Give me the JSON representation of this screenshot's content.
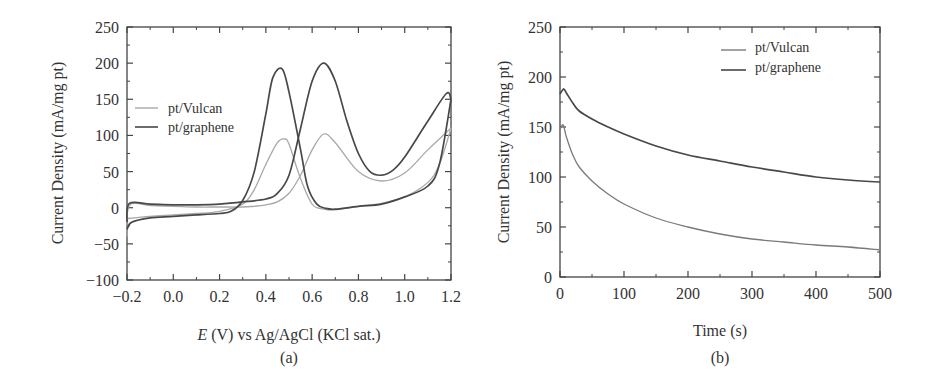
{
  "chart_data": [
    {
      "panel": "(a)",
      "type": "line",
      "title": "",
      "xlabel_italic": "E",
      "xlabel_rest": " (V) vs Ag/AgCl (KCl sat.)",
      "ylabel": "Current Density (mA/mg pt)",
      "xlim": [
        -0.2,
        1.2
      ],
      "ylim": [
        -100,
        250
      ],
      "xticks": [
        "−0.2",
        "0.0",
        "0.2",
        "0.4",
        "0.6",
        "0.8",
        "1.0",
        "1.2"
      ],
      "yticks": [
        "250",
        "200",
        "150",
        "100",
        "50",
        "0",
        "−50",
        "−100"
      ],
      "legend_position": "upper left",
      "series": [
        {
          "name": "pt/Vulcan",
          "color": "#a8a8a8",
          "forward_scan": {
            "x": [
              -0.2,
              -0.19,
              -0.1,
              0.0,
              0.1,
              0.2,
              0.3,
              0.35,
              0.4,
              0.45,
              0.5,
              0.55,
              0.6,
              0.65,
              0.7,
              0.8,
              0.9,
              1.0,
              1.1,
              1.2
            ],
            "y": [
              -40,
              3,
              3,
              2,
              1,
              1,
              1,
              2,
              4,
              8,
              20,
              45,
              80,
              102,
              90,
              50,
              37,
              48,
              80,
              110
            ]
          },
          "reverse_scan": {
            "x": [
              1.2,
              1.15,
              1.1,
              1.0,
              0.9,
              0.8,
              0.7,
              0.65,
              0.6,
              0.55,
              0.5,
              0.48,
              0.45,
              0.4,
              0.35,
              0.3,
              0.2,
              0.1,
              0.0,
              -0.1,
              -0.2
            ],
            "y": [
              110,
              60,
              35,
              15,
              6,
              2,
              -3,
              -2,
              5,
              40,
              88,
              95,
              90,
              60,
              25,
              5,
              -5,
              -8,
              -10,
              -12,
              -15
            ]
          }
        },
        {
          "name": "pt/graphene",
          "color": "#484848",
          "forward_scan": {
            "x": [
              -0.2,
              -0.19,
              -0.1,
              0.0,
              0.1,
              0.2,
              0.3,
              0.4,
              0.45,
              0.5,
              0.55,
              0.6,
              0.65,
              0.7,
              0.75,
              0.8,
              0.85,
              0.9,
              0.95,
              1.0,
              1.1,
              1.18,
              1.2
            ],
            "y": [
              -20,
              6,
              5,
              4,
              4,
              5,
              8,
              12,
              20,
              45,
              110,
              175,
              200,
              175,
              120,
              75,
              50,
              45,
              52,
              70,
              120,
              158,
              150
            ]
          },
          "reverse_scan": {
            "x": [
              1.2,
              1.15,
              1.1,
              1.0,
              0.9,
              0.8,
              0.7,
              0.66,
              0.62,
              0.58,
              0.55,
              0.5,
              0.47,
              0.43,
              0.4,
              0.35,
              0.3,
              0.25,
              0.2,
              0.1,
              0.0,
              -0.1,
              -0.18,
              -0.2
            ],
            "y": [
              150,
              60,
              30,
              15,
              5,
              2,
              -2,
              -1,
              5,
              30,
              80,
              160,
              192,
              180,
              130,
              50,
              10,
              -5,
              -8,
              -10,
              -12,
              -14,
              -20,
              -30
            ]
          }
        }
      ]
    },
    {
      "panel": "(b)",
      "type": "line",
      "title": "",
      "xlabel": "Time (s)",
      "ylabel": "Current Density (mA/mg pt)",
      "xlim": [
        0,
        500
      ],
      "ylim": [
        0,
        250
      ],
      "xticks": [
        "0",
        "100",
        "200",
        "300",
        "400",
        "500"
      ],
      "yticks": [
        "250",
        "200",
        "150",
        "100",
        "50",
        "0"
      ],
      "legend_position": "upper right",
      "series": [
        {
          "name": "pt/Vulcan",
          "color": "#7a7a7a",
          "x": [
            0,
            5,
            10,
            20,
            30,
            50,
            75,
            100,
            150,
            200,
            250,
            300,
            350,
            400,
            450,
            500
          ],
          "y": [
            148,
            152,
            140,
            122,
            110,
            96,
            83,
            73,
            59,
            50,
            43,
            38,
            35,
            32,
            30,
            27
          ]
        },
        {
          "name": "pt/graphene",
          "color": "#484848",
          "x": [
            0,
            3,
            6,
            10,
            20,
            30,
            50,
            75,
            100,
            150,
            200,
            250,
            300,
            350,
            400,
            450,
            500
          ],
          "y": [
            183,
            186,
            188,
            184,
            174,
            166,
            158,
            150,
            143,
            131,
            122,
            116,
            110,
            105,
            100,
            97,
            95
          ]
        }
      ]
    }
  ],
  "panel_a": {
    "caption": "(a)",
    "legend": [
      "pt/Vulcan",
      "pt/graphene"
    ]
  },
  "panel_b": {
    "caption": "(b)",
    "legend": [
      "pt/Vulcan",
      "pt/graphene"
    ]
  }
}
